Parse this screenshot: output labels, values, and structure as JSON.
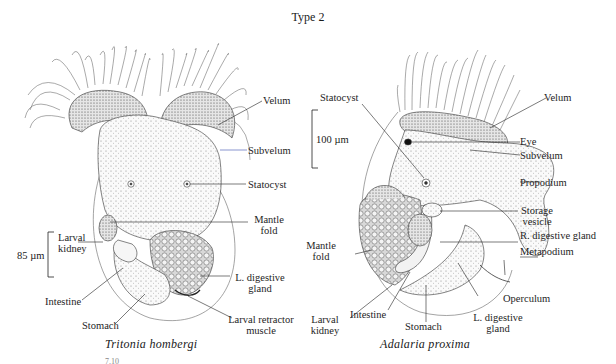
{
  "title": "Type 2",
  "figures": [
    {
      "id": "left",
      "species": "Tritonia hombergi",
      "scale_bar": "85 µm",
      "labels": {
        "velum": "Velum",
        "subvelum": "Subvelum",
        "statocyst": "Statocyst",
        "mantle_fold_1": "Mantle",
        "mantle_fold_2": "fold",
        "larval_kidney_1": "Larval",
        "larval_kidney_2": "kidney",
        "l_digestive_gland_1": "L. digestive",
        "l_digestive_gland_2": "gland",
        "intestine": "Intestine",
        "stomach": "Stomach",
        "larval_retractor_1": "Larval retractor",
        "larval_retractor_2": "muscle"
      }
    },
    {
      "id": "right",
      "species": "Adalaria proxima",
      "scale_bar": "100 µm",
      "labels": {
        "statocyst": "Statocyst",
        "velum": "Velum",
        "eye": "Eye",
        "subvelum": "Subvelum",
        "propodium": "Propodium",
        "storage_vesicle_1": "Storage",
        "storage_vesicle_2": "vesicle",
        "r_digestive_gland": "R. digestive gland",
        "metapodium": "Metapodium",
        "mantle_fold_1": "Mantle",
        "mantle_fold_2": "fold",
        "operculum": "Operculum",
        "l_digestive_gland_1": "L. digestive",
        "l_digestive_gland_2": "gland",
        "larval_kidney_1": "Larval",
        "larval_kidney_2": "kidney",
        "intestine": "Intestine",
        "stomach": "Stomach"
      }
    }
  ],
  "caption_fragment": "7.10",
  "colors": {
    "ink": "#1e1e1e",
    "subvelum_leader": "#3a4fb0",
    "stipple_fill": "#ececec",
    "background": "#ffffff"
  }
}
